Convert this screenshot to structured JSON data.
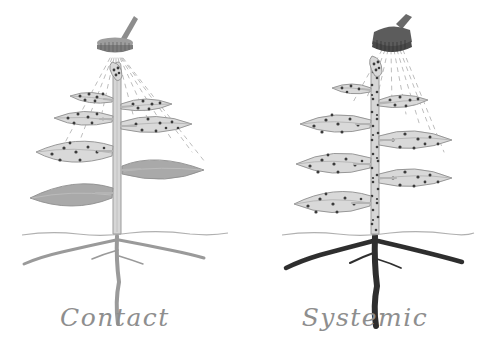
{
  "figure": {
    "background_color": "#ffffff",
    "width": 489,
    "height": 363,
    "style": "pencil sketch illustration"
  },
  "palette": {
    "outline": "#8f8f8f",
    "leaf_treated_fill": "#d9d9d9",
    "leaf_untreated_fill": "#a9a9a9",
    "stem_light": "#cfcfcf",
    "stem_dark": "#6d6d6d",
    "root_light": "#9a9a9a",
    "root_dark": "#2f2f2f",
    "dot": "#3a3a3a",
    "spray_line": "#bdbdbd",
    "nozzle_light": "#8a8a8a",
    "nozzle_dark": "#5c5c5c",
    "soil_line": "#b0b0b0",
    "caption_text": "#8e8e8e"
  },
  "panels": [
    {
      "id": "contact",
      "caption": "Contact",
      "caption_center_x": 115,
      "sprayer": {
        "icon_name": "spray-nozzle-icon",
        "label": "spray nozzle",
        "center_x": 115,
        "center_y": 46,
        "tone": "light",
        "handle_angle_deg": -22
      },
      "soil_line_y": 234,
      "stem": {
        "x": 117,
        "top_y": 62,
        "bottom_y": 234,
        "tone": "light",
        "has_dots": false
      },
      "root": {
        "tone": "light",
        "description": "pale untreated taproot with two lateral roots"
      },
      "spray_rays": 9,
      "leaves": [
        {
          "id": "apex",
          "side": "center",
          "y": 78,
          "length": 22,
          "treated": true
        },
        {
          "id": "l1-left",
          "side": "left",
          "y": 100,
          "length": 42,
          "treated": true
        },
        {
          "id": "l1-right",
          "side": "right",
          "y": 106,
          "length": 52,
          "treated": true
        },
        {
          "id": "l2-left",
          "side": "left",
          "y": 119,
          "length": 58,
          "treated": true
        },
        {
          "id": "l2-right",
          "side": "right",
          "y": 125,
          "length": 70,
          "treated": true
        },
        {
          "id": "l3-left",
          "side": "left",
          "y": 152,
          "length": 80,
          "treated": true
        },
        {
          "id": "l3-right",
          "side": "right",
          "y": 170,
          "length": 82,
          "treated": false
        },
        {
          "id": "l4-left",
          "side": "left",
          "y": 193,
          "length": 84,
          "treated": false
        }
      ]
    },
    {
      "id": "systemic",
      "caption": "Systemic",
      "caption_center_x": 365,
      "sprayer": {
        "icon_name": "spray-nozzle-icon",
        "label": "spray nozzle",
        "center_x": 392,
        "center_y": 37,
        "tone": "dark",
        "handle_angle_deg": -18
      },
      "soil_line_y": 234,
      "stem": {
        "x": 375,
        "top_y": 62,
        "bottom_y": 234,
        "tone": "light",
        "has_dots": true
      },
      "root": {
        "tone": "dark",
        "description": "darkened taproot showing translocated pesticide"
      },
      "spray_rays": 8,
      "leaves": [
        {
          "id": "apex",
          "side": "center",
          "y": 72,
          "length": 22,
          "treated": true
        },
        {
          "id": "l1-left",
          "side": "left",
          "y": 90,
          "length": 40,
          "treated": true
        },
        {
          "id": "l1-right",
          "side": "right",
          "y": 103,
          "length": 50,
          "treated": true
        },
        {
          "id": "l2-left",
          "side": "left",
          "y": 125,
          "length": 62,
          "treated": true
        },
        {
          "id": "l2-right",
          "side": "right",
          "y": 140,
          "length": 72,
          "treated": true
        },
        {
          "id": "l3-left",
          "side": "left",
          "y": 163,
          "length": 74,
          "treated": true
        },
        {
          "id": "l3-right",
          "side": "right",
          "y": 178,
          "length": 74,
          "treated": true
        },
        {
          "id": "l4-left",
          "side": "left",
          "y": 202,
          "length": 76,
          "treated": true
        }
      ]
    }
  ]
}
